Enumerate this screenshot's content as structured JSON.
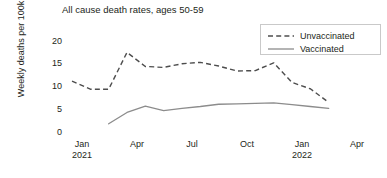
{
  "chart_data": {
    "type": "line",
    "title": "All cause death rates, ages 50-59",
    "xlabel": "",
    "ylabel": "Weekly deaths per 100k",
    "ylim": [
      0,
      22
    ],
    "yticks": [
      0,
      5,
      10,
      15,
      20
    ],
    "ytick_labels": [
      "0",
      "5",
      "10",
      "15",
      "20"
    ],
    "xtick_labels": [
      "Jan\n2021",
      "Apr",
      "Jul",
      "Oct",
      "Jan\n2022",
      "Apr"
    ],
    "xticks": [
      {
        "label": "Jan",
        "sublabel": "2021"
      },
      {
        "label": "Apr",
        "sublabel": ""
      },
      {
        "label": "Jul",
        "sublabel": ""
      },
      {
        "label": "Oct",
        "sublabel": ""
      },
      {
        "label": "Jan",
        "sublabel": "2022"
      },
      {
        "label": "Apr",
        "sublabel": ""
      }
    ],
    "x": [
      "2021-01",
      "2021-02",
      "2021-03",
      "2021-04",
      "2021-05",
      "2021-06",
      "2021-07",
      "2021-08",
      "2021-09",
      "2021-10",
      "2021-11",
      "2021-12",
      "2022-01",
      "2022-02",
      "2022-03"
    ],
    "grid": false,
    "legend_position": "top-right",
    "series": [
      {
        "name": "Unvaccinated",
        "style": "dashed",
        "color": "#4d4d4d",
        "x": [
          "2021-01",
          "2021-02",
          "2021-03",
          "2021-04",
          "2021-05",
          "2021-06",
          "2021-07",
          "2021-08",
          "2021-09",
          "2021-10",
          "2021-11",
          "2021-12",
          "2022-01",
          "2022-02",
          "2022-03"
        ],
        "values": [
          11.2,
          9.4,
          9.4,
          17.5,
          14.4,
          14.2,
          15.0,
          15.3,
          14.5,
          13.4,
          13.5,
          15.2,
          10.9,
          9.5,
          6.5
        ]
      },
      {
        "name": "Vaccinated",
        "style": "solid",
        "color": "#8c8c8c",
        "x": [
          "2021-03",
          "2021-04",
          "2021-05",
          "2021-06",
          "2021-07",
          "2021-08",
          "2021-09",
          "2021-10",
          "2021-11",
          "2021-12",
          "2022-01",
          "2022-02",
          "2022-03"
        ],
        "values": [
          1.8,
          4.3,
          5.7,
          4.7,
          5.2,
          5.6,
          6.1,
          6.2,
          6.3,
          6.4,
          6.0,
          5.6,
          5.2
        ]
      }
    ]
  },
  "legend": {
    "items": [
      {
        "label": "Unvaccinated",
        "style": "dashed"
      },
      {
        "label": "Vaccinated",
        "style": "solid"
      }
    ]
  }
}
